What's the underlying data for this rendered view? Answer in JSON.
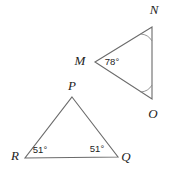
{
  "figure": {
    "background_color": "#ffffff",
    "stroke_color": "#6b6b6b",
    "arc_color": "#8a8a8a",
    "label_color": "#1d1d1d"
  },
  "triangles": [
    {
      "id": "triangle-mno",
      "name": "Triangle MNO",
      "vertices": [
        {
          "id": "vertex-m",
          "label": "M",
          "x": 95,
          "y": 62,
          "label_x": 80,
          "label_y": 62
        },
        {
          "id": "vertex-n",
          "label": "N",
          "x": 152,
          "y": 27,
          "label_x": 154,
          "label_y": 11
        },
        {
          "id": "vertex-o",
          "label": "O",
          "x": 152,
          "y": 99,
          "label_x": 153,
          "label_y": 115
        }
      ],
      "angles": [
        {
          "id": "angle-m",
          "at": "M",
          "value": "78°",
          "label_x": 112,
          "label_y": 62,
          "show_text": true,
          "show_arc": false
        },
        {
          "id": "angle-n",
          "at": "N",
          "value": "",
          "label_x": 0,
          "label_y": 0,
          "show_text": false,
          "show_arc": true
        },
        {
          "id": "angle-o",
          "at": "O",
          "value": "",
          "label_x": 0,
          "label_y": 0,
          "show_text": false,
          "show_arc": true
        }
      ]
    },
    {
      "id": "triangle-pqr",
      "name": "Triangle PQR",
      "vertices": [
        {
          "id": "vertex-p",
          "label": "P",
          "x": 72,
          "y": 97,
          "label_x": 72,
          "label_y": 87
        },
        {
          "id": "vertex-q",
          "label": "Q",
          "x": 118,
          "y": 157,
          "label_x": 126,
          "label_y": 158
        },
        {
          "id": "vertex-r",
          "label": "R",
          "x": 25,
          "y": 158,
          "label_x": 15,
          "label_y": 157
        }
      ],
      "angles": [
        {
          "id": "angle-r",
          "at": "R",
          "value": "51°",
          "label_x": 40,
          "label_y": 150,
          "show_text": true,
          "show_arc": false
        },
        {
          "id": "angle-q",
          "at": "Q",
          "value": "51°",
          "label_x": 97,
          "label_y": 149,
          "show_text": true,
          "show_arc": false
        }
      ]
    }
  ]
}
